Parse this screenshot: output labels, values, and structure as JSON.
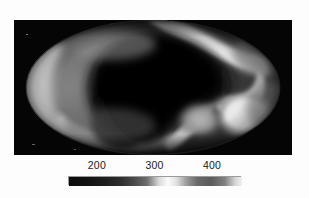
{
  "figure": {
    "type": "all-sky-mollweide-map",
    "background_color": "#ffffff",
    "panel_background_color": "#050505"
  },
  "chart_data": {
    "type": "heatmap",
    "projection": "mollweide",
    "title": "",
    "subtitle": "",
    "xlabel": "",
    "ylabel": "",
    "grid": false,
    "legend_position": "bottom",
    "colormap": "grayscale",
    "colorbar": {
      "orientation": "horizontal",
      "vmin": 150,
      "vmax": 450,
      "tick_values": [
        200,
        300,
        400
      ],
      "tick_labels": [
        "200",
        "300",
        "400"
      ],
      "tick_positions_frac": [
        0.167,
        0.5,
        0.833
      ],
      "gradient_stops": [
        {
          "pos": 0.0,
          "value": 150,
          "hex": "#0b0b0b"
        },
        {
          "pos": 0.1,
          "value": 180,
          "hex": "#121212"
        },
        {
          "pos": 0.2,
          "value": 210,
          "hex": "#1d1d1d"
        },
        {
          "pos": 0.3,
          "value": 240,
          "hex": "#2e2e2e"
        },
        {
          "pos": 0.38,
          "value": 264,
          "hex": "#4b4b4b"
        },
        {
          "pos": 0.45,
          "value": 285,
          "hex": "#6d6d6d"
        },
        {
          "pos": 0.52,
          "value": 306,
          "hex": "#d9d9d9"
        },
        {
          "pos": 0.57,
          "value": 321,
          "hex": "#fbfbfb"
        },
        {
          "pos": 0.62,
          "value": 336,
          "hex": "#e2e2e2"
        },
        {
          "pos": 0.68,
          "value": 354,
          "hex": "#9a9a9a"
        },
        {
          "pos": 0.74,
          "value": 372,
          "hex": "#6a6a6a"
        },
        {
          "pos": 0.82,
          "value": 396,
          "hex": "#5a5a5a"
        },
        {
          "pos": 0.9,
          "value": 420,
          "hex": "#808080"
        },
        {
          "pos": 0.96,
          "value": 438,
          "hex": "#d5d5d5"
        },
        {
          "pos": 1.0,
          "value": 450,
          "hex": "#f2f2f2"
        }
      ]
    },
    "features": [
      {
        "name": "central-dark-region",
        "description": "large low-value dark lobe filling the centre and upper-right-centre of the map",
        "approx_value": 170
      },
      {
        "name": "bright-ridge-upper-right",
        "description": "narrow high-value white filament sweeping from top-centre down the right side",
        "approx_value": 330
      },
      {
        "name": "bright-blob-lower-right",
        "description": "compact very bright high-value blob in the lower right quadrant",
        "approx_value": 440
      },
      {
        "name": "bright-arc-left-limb",
        "description": "broad bright arc following the left limb of the ellipse",
        "approx_value": 330
      },
      {
        "name": "bright-band-lower-left",
        "description": "bright band running along the lower-left limb",
        "approx_value": 320
      },
      {
        "name": "mid-grey-interior-left",
        "description": "mid-value grey plateau filling the left interior",
        "approx_value": 250
      },
      {
        "name": "dark-limb-edges",
        "description": "dark falloff at extreme top and bottom of the ellipse",
        "approx_value": 190
      }
    ]
  },
  "colorbar_labels": [
    {
      "text": "200"
    },
    {
      "text": "300"
    },
    {
      "text": "400"
    }
  ]
}
